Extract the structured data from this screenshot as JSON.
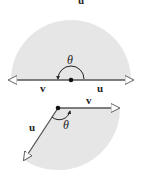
{
  "colors": {
    "shade": "#e6e6e6",
    "line": "#333333",
    "arrow_fill": "#ffffff"
  },
  "top_partial": {
    "label": "u"
  },
  "figure1": {
    "description": "Vectors u and v pointing in opposite directions, angle theta = 180 degrees",
    "label_u": "u",
    "label_v": "v",
    "angle_label": "θ"
  },
  "figure2": {
    "description": "Vectors u and v forming an obtuse angle theta",
    "label_u": "u",
    "label_v": "v",
    "angle_label": "θ"
  }
}
